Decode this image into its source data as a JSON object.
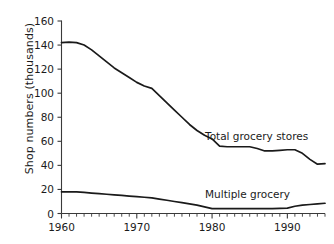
{
  "chart_data": {
    "type": "line",
    "title": "",
    "xlabel": "",
    "ylabel": "Shop numbers (thousands)",
    "xlim": [
      1960,
      1995
    ],
    "ylim": [
      0,
      160
    ],
    "grid": false,
    "legend_position": "inline-annotation",
    "y_ticks": [
      0,
      20,
      40,
      60,
      80,
      100,
      120,
      140,
      160
    ],
    "y_tick_labels": [
      "0",
      "20",
      "40",
      "60",
      "80",
      "100",
      "120",
      "140",
      "160"
    ],
    "x_ticks": [
      1960,
      1970,
      1980,
      1990
    ],
    "x_tick_labels": [
      "1960",
      "1970",
      "1980",
      "1990"
    ],
    "x_minor_tick_interval": 1,
    "series": [
      {
        "name": "Total grocery stores",
        "color": "#1a1a1a",
        "x": [
          1960,
          1961,
          1962,
          1963,
          1964,
          1965,
          1966,
          1967,
          1968,
          1969,
          1970,
          1971,
          1972,
          1973,
          1974,
          1975,
          1976,
          1977,
          1978,
          1979,
          1980,
          1981,
          1982,
          1983,
          1984,
          1985,
          1986,
          1987,
          1988,
          1989,
          1990,
          1991,
          1992,
          1993,
          1994,
          1995
        ],
        "values": [
          142,
          142.5,
          142,
          140,
          136,
          131,
          126,
          121,
          117,
          113,
          109,
          106,
          104,
          98,
          92,
          86,
          80,
          74,
          69,
          65,
          62,
          56,
          55.5,
          55.5,
          55.5,
          55.5,
          54,
          52,
          52,
          52.5,
          53,
          53,
          50,
          45,
          41,
          41.5
        ]
      },
      {
        "name": "Multiple grocery",
        "color": "#1a1a1a",
        "x": [
          1960,
          1961,
          1962,
          1963,
          1964,
          1965,
          1966,
          1967,
          1968,
          1969,
          1970,
          1971,
          1972,
          1973,
          1974,
          1975,
          1976,
          1977,
          1978,
          1979,
          1980,
          1981,
          1982,
          1983,
          1984,
          1985,
          1986,
          1987,
          1988,
          1989,
          1990,
          1991,
          1992,
          1993,
          1994,
          1995
        ],
        "values": [
          18,
          18,
          18,
          17.5,
          17,
          16.5,
          16,
          15.5,
          15,
          14.5,
          14,
          13.5,
          13,
          12,
          11,
          10,
          9,
          8,
          7,
          5.5,
          4,
          4,
          4,
          4,
          4,
          4,
          4,
          4,
          4,
          4.2,
          4.5,
          6,
          7,
          7.5,
          8,
          8.5
        ]
      }
    ],
    "annotations": [
      {
        "text": "Total grocery stores",
        "x": 1982,
        "y": 68
      },
      {
        "text": "Multiple grocery",
        "x": 1982,
        "y": 14
      }
    ]
  },
  "colors": {
    "axis": "#3a3a3a",
    "line": "#1a1a1a",
    "background": "#ffffff",
    "text": "#1b1b1b"
  }
}
